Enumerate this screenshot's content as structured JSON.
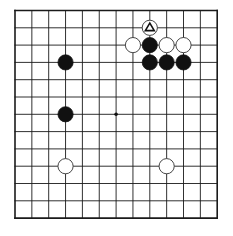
{
  "board": {
    "size": 13,
    "origin_x": 15,
    "origin_y": 10.5,
    "spacing_x": 16.85,
    "spacing_y": 17.3,
    "line_color": "#1a1a1a",
    "edge_width": 1.6,
    "line_width": 0.9,
    "stone_radius": 7.6,
    "star_points": [
      {
        "col": 6,
        "row": 6
      }
    ]
  },
  "stones": [
    {
      "color": "white",
      "col": 8,
      "row": 1,
      "marker": "triangle"
    },
    {
      "color": "white",
      "col": 7,
      "row": 2
    },
    {
      "color": "black",
      "col": 8,
      "row": 2
    },
    {
      "color": "white",
      "col": 9,
      "row": 2
    },
    {
      "color": "white",
      "col": 10,
      "row": 2
    },
    {
      "color": "black",
      "col": 8,
      "row": 3
    },
    {
      "color": "black",
      "col": 9,
      "row": 3
    },
    {
      "color": "black",
      "col": 10,
      "row": 3
    },
    {
      "color": "black",
      "col": 3,
      "row": 3
    },
    {
      "color": "black",
      "col": 3,
      "row": 6
    },
    {
      "color": "white",
      "col": 3,
      "row": 9
    },
    {
      "color": "white",
      "col": 9,
      "row": 9
    }
  ]
}
